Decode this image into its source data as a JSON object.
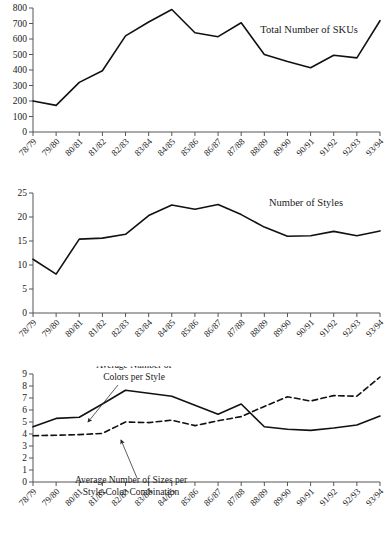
{
  "figure": {
    "title": "",
    "categories": [
      "78/79",
      "79/80",
      "80/81",
      "81/82",
      "82/83",
      "83/84",
      "84/85",
      "85/86",
      "86/87",
      "87/88",
      "88/89",
      "89/90",
      "90/91",
      "91/92",
      "92/93",
      "93/94"
    ]
  },
  "chart_data": [
    {
      "type": "line",
      "title": "Total Number of SKUs",
      "xlabel": "",
      "ylabel": "",
      "ylim": [
        0,
        800
      ],
      "yticks": [
        0,
        100,
        200,
        300,
        400,
        500,
        600,
        700,
        800
      ],
      "ytick_labels": [
        "0",
        "100",
        "200",
        "300",
        "400",
        "500",
        "600",
        "700",
        "800"
      ],
      "grid": false,
      "legend": "inline-label",
      "categories": [
        "78/79",
        "79/80",
        "80/81",
        "81/82",
        "82/83",
        "83/84",
        "84/85",
        "85/86",
        "86/87",
        "87/88",
        "88/89",
        "89/90",
        "90/91",
        "91/92",
        "92/93",
        "93/94"
      ],
      "series": [
        {
          "name": "Total Number of SKUs",
          "style": "solid",
          "values": [
            200,
            172,
            320,
            395,
            620,
            710,
            790,
            640,
            615,
            705,
            500,
            455,
            415,
            495,
            478,
            718
          ]
        }
      ],
      "annotations": [
        {
          "text": "Total Number of SKUs",
          "x_frac": 0.655,
          "y_value": 640
        }
      ]
    },
    {
      "type": "line",
      "title": "Number of Styles",
      "xlabel": "",
      "ylabel": "",
      "ylim": [
        0,
        25
      ],
      "yticks": [
        0,
        5,
        10,
        15,
        20,
        25
      ],
      "ytick_labels": [
        "0",
        "5",
        "10",
        "15",
        "20",
        "25"
      ],
      "grid": false,
      "legend": "inline-label",
      "categories": [
        "78/79",
        "79/80",
        "80/81",
        "81/82",
        "82/83",
        "83/84",
        "84/85",
        "85/86",
        "86/87",
        "87/88",
        "88/89",
        "89/90",
        "90/91",
        "91/92",
        "92/93",
        "93/94"
      ],
      "series": [
        {
          "name": "Number of Styles",
          "style": "solid",
          "values": [
            11.2,
            8.1,
            15.4,
            15.6,
            16.4,
            20.3,
            22.5,
            21.6,
            22.6,
            20.5,
            17.9,
            16.0,
            16.1,
            17.0,
            16.1,
            17.1
          ]
        }
      ],
      "annotations": [
        {
          "text": "Number of Styles",
          "x_frac": 0.68,
          "y_value": 22.3
        }
      ]
    },
    {
      "type": "line",
      "title": "",
      "xlabel": "",
      "ylabel": "",
      "ylim": [
        0,
        9
      ],
      "yticks": [
        0,
        1,
        2,
        3,
        4,
        5,
        6,
        7,
        8,
        9
      ],
      "ytick_labels": [
        "0",
        "1",
        "2",
        "3",
        "4",
        "5",
        "6",
        "7",
        "8",
        "9"
      ],
      "grid": false,
      "legend": "annotated-arrows",
      "categories": [
        "78/79",
        "79/80",
        "80/81",
        "81/82",
        "82/83",
        "83/84",
        "84/85",
        "85/86",
        "86/87",
        "87/88",
        "88/89",
        "89/90",
        "90/91",
        "91/92",
        "92/93",
        "93/94"
      ],
      "series": [
        {
          "name": "Average Number of Colors per Style",
          "style": "solid",
          "values": [
            4.6,
            5.3,
            5.4,
            6.5,
            7.65,
            7.4,
            7.15,
            6.4,
            5.65,
            6.5,
            4.6,
            4.4,
            4.3,
            4.5,
            4.75,
            5.5
          ]
        },
        {
          "name": "Average Number of Sizes per Style-Color Combination",
          "style": "dashed",
          "values": [
            3.85,
            3.9,
            3.95,
            4.05,
            5.0,
            4.95,
            5.15,
            4.7,
            5.1,
            5.45,
            6.3,
            7.1,
            6.75,
            7.2,
            7.15,
            8.75
          ]
        }
      ],
      "annotations": [
        {
          "text_lines": [
            "Average Number of",
            "Colors per Style"
          ],
          "label_x": 134,
          "label_y_top": 368,
          "arrow_from_x": 118,
          "arrow_from_y": 385,
          "arrow_to_x": 88,
          "arrow_to_y": 422
        },
        {
          "text_lines": [
            "Average Number of Sizes per",
            "Style-Color Combination"
          ],
          "label_x": 131,
          "label_y_top": 483,
          "arrow_from_x": 137,
          "arrow_from_y": 478,
          "arrow_to_x": 121,
          "arrow_to_y": 440
        }
      ]
    }
  ]
}
